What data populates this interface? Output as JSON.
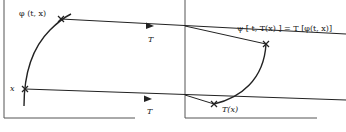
{
  "diagram": {
    "left_panel": {
      "labels": {
        "phi": "φ (t, x)",
        "x": "x"
      }
    },
    "right_panel": {
      "labels": {
        "equation": "ψ [ t, T(x) ] = T [φ(t, x)]",
        "Tx": "T(x)"
      }
    },
    "arrows": {
      "top_label": "T",
      "bottom_label": "T"
    },
    "colors": {
      "ink": "#222222",
      "axis": "#555555",
      "background": "#ffffff"
    }
  }
}
